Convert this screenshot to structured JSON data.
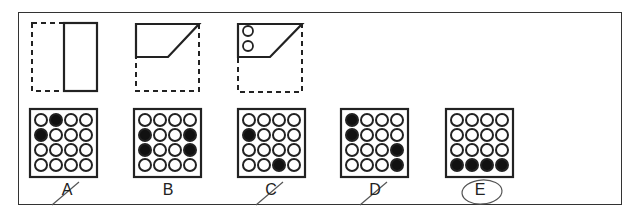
{
  "question": {
    "folding_steps": [
      {
        "id": "step-1",
        "description": "Square paper folded right-to-left half; left half dashed, right half solid rectangle",
        "dashed_rect": {
          "x": 32,
          "y": 23,
          "w": 65,
          "h": 68
        },
        "solid_rect": {
          "x": 64,
          "y": 23,
          "w": 33,
          "h": 68
        }
      },
      {
        "id": "step-2",
        "description": "Bottom portion folded up with diagonal edge",
        "dashed_rect": {
          "x": 136,
          "y": 24,
          "w": 63,
          "h": 67
        },
        "solid_poly": "136,24 199,24 168,57 136,57"
      },
      {
        "id": "step-3",
        "description": "Folded shape punched with two holes",
        "dashed_rect": {
          "x": 238,
          "y": 24,
          "w": 64,
          "h": 68
        },
        "solid_poly": "238,24 302,24 270,57 238,57",
        "holes": [
          {
            "cx": 248,
            "cy": 31,
            "r": 5
          },
          {
            "cx": 248,
            "cy": 46,
            "r": 5
          }
        ]
      }
    ]
  },
  "options": [
    {
      "label": "A",
      "box_x": 30,
      "filled": [
        [
          0,
          1
        ],
        [
          1,
          0
        ]
      ],
      "mark": "slash"
    },
    {
      "label": "B",
      "box_x": 134,
      "filled": [
        [
          1,
          0
        ],
        [
          1,
          3
        ],
        [
          2,
          0
        ],
        [
          2,
          3
        ]
      ],
      "mark": "none"
    },
    {
      "label": "C",
      "box_x": 238,
      "filled": [
        [
          1,
          0
        ],
        [
          3,
          2
        ]
      ],
      "mark": "slash"
    },
    {
      "label": "D",
      "box_x": 341,
      "filled": [
        [
          0,
          0
        ],
        [
          1,
          0
        ],
        [
          2,
          3
        ],
        [
          3,
          3
        ]
      ],
      "mark": "slash"
    },
    {
      "label": "E",
      "box_x": 446,
      "filled": [
        [
          3,
          0
        ],
        [
          3,
          1
        ],
        [
          3,
          2
        ],
        [
          3,
          3
        ]
      ],
      "mark": "circle"
    }
  ],
  "selected_answer": "E",
  "colors": {
    "ink": "#222222",
    "frame": "#333333",
    "pen": "#555555"
  }
}
